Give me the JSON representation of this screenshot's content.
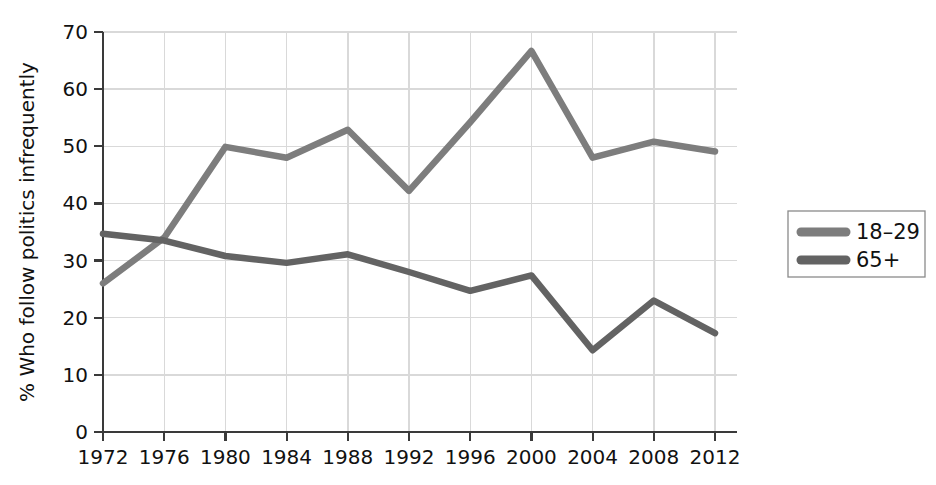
{
  "chart_data": {
    "type": "line",
    "title": "",
    "xlabel": "",
    "ylabel": "% Who follow politics infrequently",
    "x": [
      1972,
      1976,
      1980,
      1984,
      1988,
      1992,
      1996,
      2000,
      2004,
      2008,
      2012
    ],
    "xtick_labels": [
      "1972",
      "1976",
      "1980",
      "1984",
      "1988",
      "1992",
      "1996",
      "2000",
      "2004",
      "2008",
      "2012"
    ],
    "ytick_labels": [
      "0",
      "10",
      "20",
      "30",
      "40",
      "50",
      "60",
      "70"
    ],
    "yticks": [
      0,
      10,
      20,
      30,
      40,
      50,
      60,
      70
    ],
    "ylim": [
      0,
      70
    ],
    "xlim": [
      1970,
      2014
    ],
    "grid": true,
    "legend_position": "right-outside",
    "series": [
      {
        "name": "18–29",
        "color": "#7d7d7d",
        "values": [
          26.0,
          34.0,
          49.9,
          48.0,
          52.9,
          42.2,
          54.2,
          66.7,
          48.0,
          50.8,
          49.1
        ]
      },
      {
        "name": "65+",
        "color": "#636363",
        "values": [
          34.7,
          33.5,
          30.8,
          29.6,
          31.1,
          28.0,
          24.7,
          27.4,
          14.3,
          23.0,
          17.3
        ]
      }
    ]
  },
  "legend": {
    "entries": [
      {
        "label": "18–29"
      },
      {
        "label": "65+"
      }
    ]
  },
  "colors": {
    "series_18_29": "#7d7d7d",
    "series_65_plus": "#636363",
    "grid": "#d9d9d9",
    "axis": "#3a3a3a",
    "text": "#111111",
    "background": "#ffffff"
  }
}
